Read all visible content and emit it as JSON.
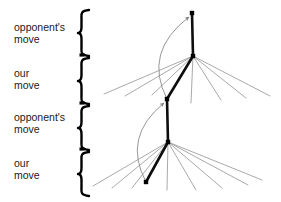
{
  "figure": {
    "width": 281,
    "height": 202,
    "background": "#ffffff"
  },
  "ply_labels": [
    {
      "id": "ply-1",
      "text": "opponent's\nmove",
      "x": 14,
      "y": 22,
      "brace_top": 10,
      "brace_bottom": 56
    },
    {
      "id": "ply-2",
      "text": "our\nmove",
      "x": 14,
      "y": 68,
      "brace_top": 58,
      "brace_bottom": 104
    },
    {
      "id": "ply-3",
      "text": "opponent's\nmove",
      "x": 14,
      "y": 112,
      "brace_top": 106,
      "brace_bottom": 150
    },
    {
      "id": "ply-4",
      "text": "our\nmove",
      "x": 14,
      "y": 158,
      "brace_top": 152,
      "brace_bottom": 196
    }
  ],
  "brace": {
    "x": 78,
    "color": "#000000",
    "stroke_width": 2.4,
    "arm_width": 11
  },
  "tree": {
    "node_color": "#000000",
    "node_size": 4.4,
    "principal_color": "#0d0d0d",
    "principal_width": 2.6,
    "fan_color": "#9a9a9a",
    "fan_width": 0.85,
    "arrow_color": "#8a8a8a",
    "arrow_width": 0.9,
    "nodes": [
      {
        "id": "root",
        "label": "root-node",
        "x": 192,
        "y": 13
      },
      {
        "id": "n2",
        "label": "opponent-choice-node",
        "x": 193,
        "y": 56
      },
      {
        "id": "n3",
        "label": "our-choice-node",
        "x": 167,
        "y": 99
      },
      {
        "id": "n4",
        "label": "opponent-choice-node-lower",
        "x": 168,
        "y": 142
      },
      {
        "id": "n5",
        "label": "leaf-node",
        "x": 146,
        "y": 182
      }
    ],
    "principal_path": [
      {
        "from": "root",
        "to": "n2"
      },
      {
        "from": "n2",
        "to": "n3"
      },
      {
        "from": "n3",
        "to": "n4"
      },
      {
        "from": "n4",
        "to": "n5"
      }
    ],
    "fan_upper": {
      "origin": {
        "x": 193,
        "y": 56
      },
      "endpoints": [
        {
          "x": 104,
          "y": 94
        },
        {
          "x": 125,
          "y": 96
        },
        {
          "x": 152,
          "y": 95
        },
        {
          "x": 191,
          "y": 103
        },
        {
          "x": 221,
          "y": 100
        },
        {
          "x": 246,
          "y": 98
        },
        {
          "x": 270,
          "y": 96
        }
      ]
    },
    "fan_lower": {
      "origin": {
        "x": 168,
        "y": 142
      },
      "endpoints": [
        {
          "x": 93,
          "y": 186
        },
        {
          "x": 112,
          "y": 188
        },
        {
          "x": 132,
          "y": 188
        },
        {
          "x": 167,
          "y": 190
        },
        {
          "x": 196,
          "y": 190
        },
        {
          "x": 222,
          "y": 188
        },
        {
          "x": 248,
          "y": 185
        },
        {
          "x": 262,
          "y": 180
        }
      ]
    },
    "backup_arrows": [
      {
        "id": "backup-upper",
        "label": "value-backup-arrow-upper",
        "from": {
          "x": 167,
          "y": 99
        },
        "to": {
          "x": 189,
          "y": 17
        },
        "control": {
          "x": 143,
          "y": 52
        }
      },
      {
        "id": "backup-lower",
        "label": "value-backup-arrow-lower",
        "from": {
          "x": 146,
          "y": 182
        },
        "to": {
          "x": 164,
          "y": 103
        },
        "control": {
          "x": 122,
          "y": 137
        }
      }
    ]
  }
}
